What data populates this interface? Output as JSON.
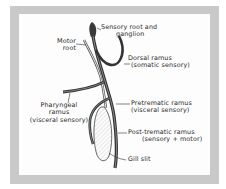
{
  "figure": {
    "frame_color": "#c9c9c9",
    "panel_color": "#fdfdfd",
    "line_color": "#333333",
    "labels": {
      "sensory_root": {
        "line1": "Sensory root and",
        "line2": "ganglion"
      },
      "motor_root": {
        "line1": "Motor",
        "line2": "root"
      },
      "dorsal_ramus": {
        "line1": "Dorsal ramus",
        "line2": "(somatic sensory)"
      },
      "pharyngeal_ramus": {
        "line1": "Pharyngeal",
        "line2": "ramus",
        "line3": "(visceral sensory)"
      },
      "pretrematic_ramus": {
        "line1": "Pretrematic ramus",
        "line2": "(visceral sensory)"
      },
      "posttrematic_ramus": {
        "line1": "Post-trematic ramus",
        "line2": "(sensory + motor)"
      },
      "gill_slit": {
        "line1": "Gill slit"
      }
    }
  }
}
